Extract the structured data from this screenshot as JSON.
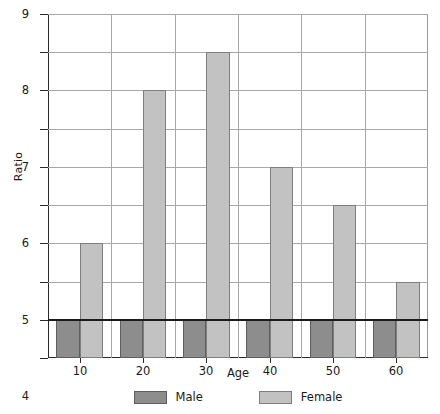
{
  "chart_data": {
    "type": "bar",
    "title": "",
    "subtitle": "",
    "xlabel": "Age",
    "ylabel": "Ratio",
    "categories": [
      "10",
      "20",
      "30",
      "40",
      "50",
      "60"
    ],
    "series": [
      {
        "name": "Male",
        "color": "#8d8d8d",
        "values": [
          1,
          1,
          1,
          1,
          1,
          1
        ]
      },
      {
        "name": "Female",
        "color": "#c2c2c2",
        "values": [
          3,
          7,
          8,
          5,
          4,
          2
        ]
      }
    ],
    "ylim": [
      0,
      9
    ],
    "yticks": [
      "0",
      "1",
      "2",
      "3",
      "4",
      "5",
      "6",
      "7",
      "8",
      "9"
    ],
    "xticks": [
      "10",
      "20",
      "30",
      "40",
      "50",
      "60"
    ],
    "grid": "both",
    "legend_position": "bottom",
    "annotations": [
      {
        "type": "reference-line",
        "axis": "y",
        "value": 1,
        "color": "#1b1b1b"
      }
    ]
  },
  "legend": {
    "items": [
      {
        "label": "Male",
        "key": "male"
      },
      {
        "label": "Female",
        "key": "female"
      }
    ]
  }
}
